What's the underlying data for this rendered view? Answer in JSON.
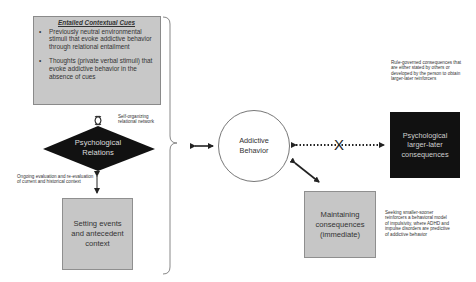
{
  "cues_box": {
    "title": "Entailed Contextual Cues",
    "bullets": [
      "Previously neutral environmental stimuli that evoke addictive behavior through relational entailment",
      "Thoughts (private verbal stimuli) that evoke addictive behavior in the absence of cues"
    ]
  },
  "loop_note": "Self-organizing relational network",
  "diamond": {
    "line1": "Psychological",
    "line2": "Relations"
  },
  "evaluation_note": "Ongoing evaluation and re-evaluation of current and historical context",
  "setting_box": {
    "label": "Setting events and antecedent context"
  },
  "center_circle": {
    "line1": "Addictive",
    "line2": "Behavior"
  },
  "rule_note": "Rule-governed consequences that are either stated by others or developed by the person to obtain larger-later reinforcers",
  "larger_later_box": {
    "label": "Psychological larger-later consequences"
  },
  "maintaining_box": {
    "label": "Maintaining consequences (immediate)"
  },
  "impulsivity_note": "Seeking smaller-sooner reinforcers a behavioral model of impulsivity, where ADHD and impulse disorders are predictive of addictive behavior",
  "blocked_marker": "X",
  "colors": {
    "gray_box": "#c6c6c6",
    "black_box": "#111111",
    "diamond": "#111111",
    "arrow": "#222222",
    "brace": "#888888"
  }
}
